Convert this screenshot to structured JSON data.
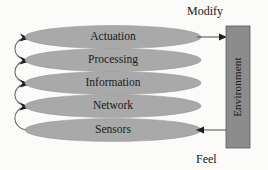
{
  "diagram": {
    "background_color": "#fbfbf9",
    "layers": [
      {
        "label": "Actuation",
        "cy": 37,
        "fill": "#a9a9a9"
      },
      {
        "label": "Processing",
        "cy": 60,
        "fill": "#a9a9a9"
      },
      {
        "label": "Information",
        "cy": 83,
        "fill": "#a9a9a9"
      },
      {
        "label": "Network",
        "cy": 106,
        "fill": "#a9a9a9"
      },
      {
        "label": "Sensors",
        "cy": 130,
        "fill": "#a9a9a9"
      }
    ],
    "environment": {
      "label": "Environment",
      "fill": "#8c8c8c",
      "stroke": "#555555",
      "orientation": "vertical-bottom-to-top"
    },
    "flows": [
      {
        "name": "modify",
        "label": "Modify",
        "direction": "stack-to-environment",
        "from_layer": "Actuation"
      },
      {
        "name": "feel",
        "label": "Feel",
        "direction": "environment-to-stack",
        "to_layer": "Sensors"
      }
    ],
    "internal_links": [
      {
        "from": "Processing",
        "to": "Actuation"
      },
      {
        "from": "Information",
        "to": "Processing"
      },
      {
        "from": "Network",
        "to": "Information"
      },
      {
        "from": "Sensors",
        "to": "Network"
      }
    ],
    "colors": {
      "ellipse_fill": "#a9a9a9",
      "ellipse_stroke": "#8f8f8f",
      "environment_fill": "#8c8c8c",
      "line": "#4a4a4a",
      "text": "#1a1a1a"
    }
  }
}
